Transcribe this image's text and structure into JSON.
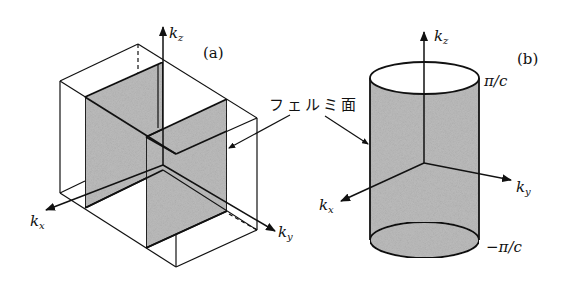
{
  "figure": {
    "panels": [
      {
        "id": "a",
        "label": "(a)",
        "axes": {
          "kz": "kz",
          "kx": "kx",
          "ky": "ky"
        },
        "description": "Brillouin zone box with two planar Fermi surface sheets"
      },
      {
        "id": "b",
        "label": "(b)",
        "axes": {
          "kz": "kz",
          "kx": "kx",
          "ky": "ky"
        },
        "bounds": {
          "top": "π/c",
          "bottom": "−π/c"
        },
        "description": "Cylindrical Fermi surface"
      }
    ],
    "annotation": "フェルミ面",
    "colors": {
      "line": "#111111",
      "surface_fill": "#bdbdbd",
      "background": "#ffffff"
    }
  },
  "labels": {
    "a_panel": "(a)",
    "b_panel": "(b)",
    "a_kz": "k",
    "a_kz_sub": "z",
    "a_kx": "k",
    "a_kx_sub": "x",
    "a_ky": "k",
    "a_ky_sub": "y",
    "b_kz": "k",
    "b_kz_sub": "z",
    "b_kx": "k",
    "b_kx_sub": "x",
    "b_ky": "k",
    "b_ky_sub": "y",
    "pi_c_top": "π/c",
    "pi_c_bottom": "−π/c",
    "fermi_surface": "フェルミ面"
  }
}
